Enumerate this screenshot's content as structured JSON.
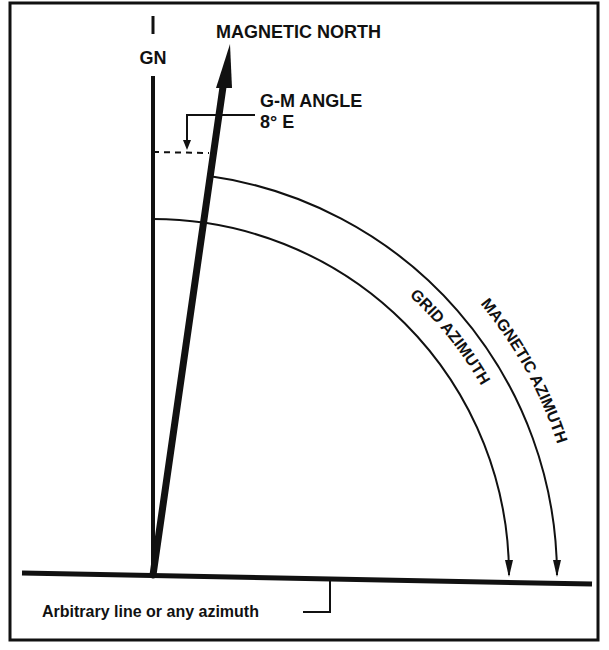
{
  "labels": {
    "grid_north": "GN",
    "magnetic_north": "MAGNETIC NORTH",
    "gm_angle_title": "G-M ANGLE",
    "gm_angle_value": "8° E",
    "magnetic_azimuth": "MAGNETIC AZIMUTH",
    "grid_azimuth": "GRID AZIMUTH",
    "baseline": "Arbitrary line or any azimuth"
  },
  "values": {
    "gm_angle_degrees": 8,
    "gm_angle_direction": "E"
  },
  "colors": {
    "line": "#111111",
    "background": "#ffffff"
  }
}
